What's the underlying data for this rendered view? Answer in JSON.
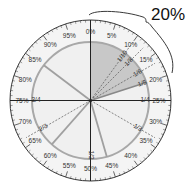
{
  "diagram": {
    "callout": {
      "label": "20%",
      "from_percent": 0,
      "to_percent": 20
    },
    "colors": {
      "outer_ring": "#f4f4f4",
      "inner_disk": "#f0f0f0",
      "shaded_wedge": "#c8c8c8",
      "inner_circle_stroke": "#a8a8a8",
      "outline": "#333333"
    },
    "percent_labels": [
      "0%",
      "5%",
      "10%",
      "15%",
      "20%",
      "25%",
      "30%",
      "35%",
      "40%",
      "45%",
      "50%",
      "55%",
      "60%",
      "65%",
      "70%",
      "75%",
      "80%",
      "85%",
      "90%",
      "95%"
    ],
    "fractions": [
      {
        "label": "1/10",
        "percent": 10,
        "style": "dashed"
      },
      {
        "label": "1/8",
        "percent": 12.5,
        "style": "dashed"
      },
      {
        "label": "1/6",
        "percent": 16.667,
        "style": "dashed"
      },
      {
        "label": "1/5",
        "percent": 20,
        "style": "solid-gray"
      },
      {
        "label": "1/4",
        "percent": 25,
        "style": "solid-dark"
      },
      {
        "label": "1/3",
        "percent": 33.333,
        "style": "dashed"
      },
      {
        "label": "1/2",
        "percent": 50,
        "style": "solid-dark"
      },
      {
        "label": "2/3",
        "percent": 66.667,
        "style": "dashed"
      },
      {
        "label": "3/4",
        "percent": 75,
        "style": "solid-dark"
      }
    ],
    "spokes_percent": [
      0,
      45.5,
      61.5,
      85.3
    ],
    "shaded_wedge": {
      "from_percent": 0,
      "to_percent": 20
    }
  }
}
